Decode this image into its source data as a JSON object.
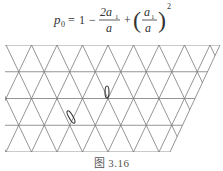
{
  "formula": {
    "lhs": "p",
    "lhs_sub": "0",
    "equals": "=",
    "one": "1",
    "minus": "−",
    "frac1_num": "2a",
    "frac1_num_sub": "1",
    "frac1_den": "a",
    "plus": "+",
    "frac2_num": "a",
    "frac2_num_sub": "1",
    "frac2_den": "a",
    "exponent": "2"
  },
  "figure": {
    "type": "triangular-lattice",
    "rows": 4,
    "line_color": "#777777",
    "markers": [
      {
        "name": "vertical-needle",
        "cx": 107,
        "cy": 92,
        "rx": 2,
        "ry": 6,
        "rotate": 0
      },
      {
        "name": "tilted-needle",
        "cx": 71,
        "cy": 117,
        "rx": 2,
        "ry": 7,
        "rotate": -30
      }
    ]
  },
  "caption": "图 3.16"
}
